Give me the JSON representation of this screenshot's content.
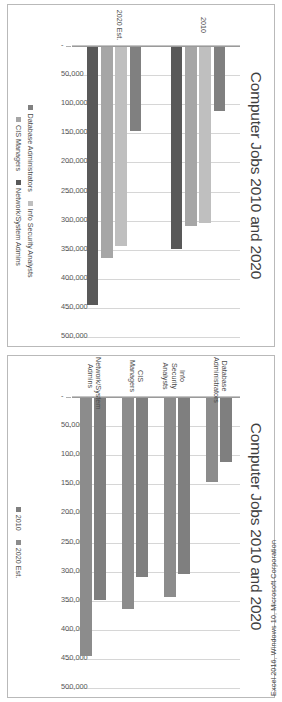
{
  "page": {
    "credit": "Excel 2016, Windows 10, Microsoft Corporation",
    "orientation_note": "rotated-90"
  },
  "colors": {
    "series_2010": "#7f7f7f",
    "series_2020": "#8c8c8c",
    "database_administrators": "#808080",
    "info_security_analysts": "#bfbfbf",
    "cis_managers": "#a6a6a6",
    "network_system_admins": "#595959",
    "gridline": "#d6d6d6",
    "axis": "#9a9a9a",
    "frame": "#b9b9b9",
    "text": "#4a4a4a"
  },
  "axis": {
    "tick_labels": [
      "500,000",
      "450,000",
      "400,000",
      "350,000",
      "300,000",
      "250,000",
      "200,000",
      "150,000",
      "100,000",
      "50,000",
      "-"
    ],
    "tick_values": [
      500000,
      450000,
      400000,
      350000,
      300000,
      250000,
      200000,
      150000,
      100000,
      50000,
      0
    ],
    "max": 500000,
    "min": 0
  },
  "chart_data": [
    {
      "id": "chart-by-occupation",
      "type": "bar",
      "orientation": "horizontal",
      "title": "Computer Jobs 2010 and 2020",
      "xlabel": "",
      "ylabel": "",
      "xlim": [
        0,
        500000
      ],
      "grid": true,
      "legend_position": "bottom",
      "categories": [
        "Database\nAdministrators",
        "Info Security\nAnalysts",
        "CIS Managers",
        "Network/System\nAdmins"
      ],
      "series": [
        {
          "name": "2010",
          "color": "#7f7f7f",
          "values": [
            110800,
            302300,
            307000,
            347200
          ]
        },
        {
          "name": "2020 Est.",
          "color": "#8c8c8c",
          "values": [
            144800,
            342000,
            363000,
            443800
          ]
        }
      ]
    },
    {
      "id": "chart-by-year",
      "type": "bar",
      "orientation": "horizontal",
      "title": "Computer Jobs 2010 and 2020",
      "xlabel": "",
      "ylabel": "",
      "xlim": [
        0,
        500000
      ],
      "grid": true,
      "legend_position": "bottom",
      "categories": [
        "2010",
        "2020 Est."
      ],
      "series": [
        {
          "name": "Database Administrators",
          "color": "#808080",
          "values": [
            110800,
            144800
          ]
        },
        {
          "name": "Info Security Analysts",
          "color": "#bfbfbf",
          "values": [
            302300,
            342000
          ]
        },
        {
          "name": "CIS Managers",
          "color": "#a6a6a6",
          "values": [
            307000,
            363000
          ]
        },
        {
          "name": "Network/System Admins",
          "color": "#595959",
          "values": [
            347200,
            443800
          ]
        }
      ]
    }
  ]
}
